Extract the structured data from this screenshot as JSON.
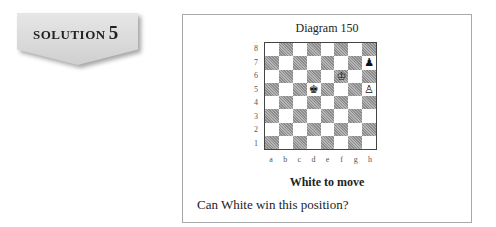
{
  "badge": {
    "word": "SOLUTION",
    "number": "5"
  },
  "diagram": {
    "title": "Diagram 150",
    "files": [
      "a",
      "b",
      "c",
      "d",
      "e",
      "f",
      "g",
      "h"
    ],
    "ranks": [
      "8",
      "7",
      "6",
      "5",
      "4",
      "3",
      "2",
      "1"
    ],
    "pieces": [
      {
        "square": "h7",
        "color": "black",
        "type": "pawn",
        "glyph": "♟"
      },
      {
        "square": "f6",
        "color": "white",
        "type": "king",
        "glyph": "♔"
      },
      {
        "square": "d5",
        "color": "black",
        "type": "king",
        "glyph": "♚"
      },
      {
        "square": "h5",
        "color": "white",
        "type": "pawn",
        "glyph": "♙"
      }
    ],
    "to_move": "White to move",
    "question": "Can White win this position?"
  },
  "colors": {
    "dark_square": "#9a9a9a",
    "light_square": "#ffffff",
    "badge_bg": "#dcdcdc",
    "panel_border": "#a8a8a8"
  }
}
